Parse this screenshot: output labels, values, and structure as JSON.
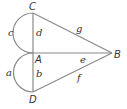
{
  "diagram": {
    "type": "geometry",
    "points": {
      "C": {
        "label": "C",
        "x": 33,
        "y": 13
      },
      "A": {
        "label": "A",
        "x": 33,
        "y": 53
      },
      "D": {
        "label": "D",
        "x": 33,
        "y": 92
      },
      "B": {
        "label": "B",
        "x": 112,
        "y": 53
      }
    },
    "segments": {
      "d": {
        "label": "d",
        "from": "C",
        "to": "A"
      },
      "b": {
        "label": "b",
        "from": "A",
        "to": "D"
      },
      "g": {
        "label": "g",
        "from": "C",
        "to": "B"
      },
      "e": {
        "label": "e",
        "from": "A",
        "to": "B"
      },
      "f": {
        "label": "f",
        "from": "D",
        "to": "B"
      }
    },
    "arcs": {
      "c": {
        "label": "c",
        "from": "C",
        "to": "A",
        "kind": "semicircle"
      },
      "a": {
        "label": "a",
        "from": "A",
        "to": "D",
        "kind": "semicircle"
      }
    },
    "line_color": "#8a8a8a",
    "text_color": "#333333"
  }
}
